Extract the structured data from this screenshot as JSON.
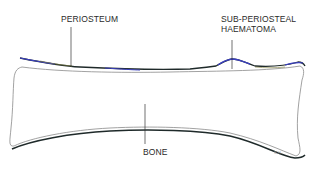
{
  "diagram": {
    "labels": {
      "periosteum": "PERIOSTEUM",
      "haematoma_line1": "SUB-PERIOSTEAL",
      "haematoma_line2": "HAEMATOMA",
      "bone": "BONE"
    },
    "signature": "S.H.",
    "caption_partial": "...",
    "colors": {
      "background": "#ffffff",
      "bone_outline": "#8a8a8a",
      "periosteum_dark": "#1f2a2a",
      "periosteum_blue": "#3a3fbf",
      "periosteum_olive": "#7a7a3a",
      "leader_line": "#333333",
      "label_text": "#2a2a2a"
    }
  }
}
